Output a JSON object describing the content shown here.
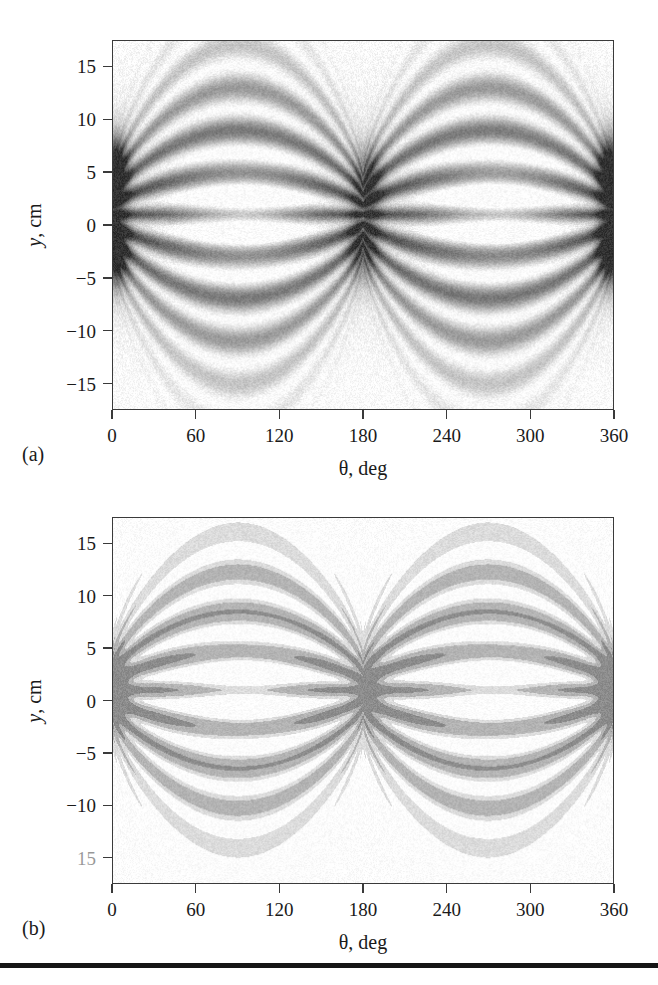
{
  "figure": {
    "background_color": "#ffffff",
    "ink_color": "#1a1a1a",
    "frame_color": "#3a3a3a",
    "rule_color": "#151515"
  },
  "panels": [
    {
      "id": "a",
      "caption": "(a)",
      "style": "smooth-grayscale",
      "frame": {
        "left": 112,
        "top": 40,
        "width": 502,
        "height": 370
      },
      "caption_pos": {
        "left": 22,
        "top": 444
      }
    },
    {
      "id": "b",
      "caption": "(b)",
      "style": "posterized-grayscale",
      "frame": {
        "left": 112,
        "top": 517,
        "width": 502,
        "height": 367
      },
      "caption_pos": {
        "left": 22,
        "top": 918
      }
    }
  ],
  "chart_data": [
    {
      "type": "heatmap",
      "panel": "a",
      "title": "",
      "subtitle": "",
      "xlabel": "θ, deg",
      "ylabel": "y, cm",
      "xlim": [
        0,
        360
      ],
      "ylim": [
        -17.5,
        17.5
      ],
      "xticks": [
        0,
        60,
        120,
        180,
        240,
        300,
        360
      ],
      "xticklabels": [
        "0",
        "60",
        "120",
        "180",
        "240",
        "300",
        "360"
      ],
      "yticks": [
        15,
        10,
        5,
        0,
        -5,
        -10,
        -15
      ],
      "yticklabels": [
        "15",
        "10",
        "5",
        "0",
        "-5",
        "-10",
        "-15"
      ],
      "grid": false,
      "legend": "none",
      "colormap": "gray_reversed",
      "value_range": [
        0,
        1
      ],
      "description": "Smooth continuous grayscale density map: two large oval interference lobes centered near theta = 90 deg and theta = 270 deg, each composed of nested concentric rings of alternating light and dark bands. The lobes pinch to dark crossing nodes at theta = 0, 180 and 360 deg near y = 4 cm and y = -2 cm.",
      "nodes": [
        {
          "theta": 0,
          "y": 5,
          "intensity": "dark"
        },
        {
          "theta": 0,
          "y": -2.5,
          "intensity": "dark"
        },
        {
          "theta": 183,
          "y": 4,
          "intensity": "dark"
        },
        {
          "theta": 180,
          "y": -2,
          "intensity": "dark"
        },
        {
          "theta": 360,
          "y": 5,
          "intensity": "dark"
        },
        {
          "theta": 360,
          "y": -2,
          "intensity": "dark"
        }
      ],
      "lobe_centers": [
        {
          "theta": 95,
          "y": 1,
          "intensity": "light"
        },
        {
          "theta": 278,
          "y": 1.5,
          "intensity": "light"
        }
      ],
      "ring_radii_cm": [
        3.5,
        7.0,
        10.5,
        14.0
      ],
      "envelope_half_height_cm": 16.5
    },
    {
      "type": "heatmap",
      "panel": "b",
      "title": "",
      "subtitle": "",
      "xlabel": "θ, deg",
      "ylabel": "y, cm",
      "xlim": [
        0,
        360
      ],
      "ylim": [
        -17.5,
        17.5
      ],
      "xticks": [
        0,
        60,
        120,
        180,
        240,
        300,
        360
      ],
      "xticklabels": [
        "0",
        "60",
        "120",
        "180",
        "240",
        "300",
        "360"
      ],
      "yticks": [
        15,
        10,
        5,
        0,
        -5,
        -10,
        -15
      ],
      "yticklabels": [
        "15",
        "10",
        "5",
        "0",
        "-5",
        "-10",
        "15"
      ],
      "grid": false,
      "legend": "none",
      "colormap": "gray_discrete",
      "levels": 4,
      "level_colors": [
        "#ffffff",
        "#dcdcdc",
        "#b4b4b4",
        "#8c8c8c"
      ],
      "value_range": [
        0,
        1
      ],
      "description": "Posterized discrete-level version of panel (a): the same two interference lobes rendered as a few flat gray contour bands. White kite-shaped cores sit near theta = 95 deg and theta = 275 deg around y = 1 cm, surrounded by a mid-gray band and a darker gray outer band; dark vertical bars appear at theta = 0, 180 and 360 deg around y = 0 to 4 cm.",
      "nodes": [
        {
          "theta": 0,
          "y": 1,
          "intensity": "dark"
        },
        {
          "theta": 183,
          "y": 1,
          "intensity": "dark"
        },
        {
          "theta": 360,
          "y": 1,
          "intensity": "dark"
        }
      ],
      "lobe_centers": [
        {
          "theta": 95,
          "y": 1,
          "intensity": "white"
        },
        {
          "theta": 275,
          "y": 1,
          "intensity": "white"
        }
      ],
      "envelope_half_height_cm": 15.5
    }
  ],
  "bottom_rule": {
    "top": 963,
    "height": 5
  }
}
